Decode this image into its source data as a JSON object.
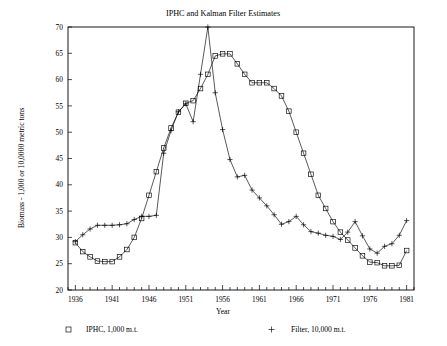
{
  "chart_data": {
    "type": "line",
    "title": "IPHC and Kalman Filter Estimates",
    "xlabel": "Year",
    "ylabel": "Biomass - 1,000 or 10,0000 metric tons",
    "xlim": [
      1935,
      1982
    ],
    "ylim": [
      20,
      70
    ],
    "yticks": [
      20,
      25,
      30,
      35,
      40,
      45,
      50,
      55,
      60,
      65,
      70
    ],
    "xticks": [
      1936,
      1941,
      1946,
      1951,
      1956,
      1961,
      1966,
      1971,
      1976,
      1981
    ],
    "grid": false,
    "legend_position": "below",
    "x": [
      1936,
      1937,
      1938,
      1939,
      1940,
      1941,
      1942,
      1943,
      1944,
      1945,
      1946,
      1947,
      1948,
      1949,
      1950,
      1951,
      1952,
      1953,
      1954,
      1955,
      1956,
      1957,
      1958,
      1959,
      1960,
      1961,
      1962,
      1963,
      1964,
      1965,
      1966,
      1967,
      1968,
      1969,
      1970,
      1971,
      1972,
      1973,
      1974,
      1975,
      1976,
      1977,
      1978,
      1979,
      1980,
      1981
    ],
    "series": [
      {
        "name": "IPHC, 1,000 m.t.",
        "marker": "square",
        "values": [
          29.0,
          27.3,
          26.3,
          25.5,
          25.4,
          25.4,
          26.3,
          27.7,
          30.0,
          33.6,
          38.0,
          42.5,
          47.0,
          50.8,
          53.8,
          55.5,
          56.0,
          58.3,
          61.0,
          64.5,
          64.9,
          64.9,
          63.0,
          61.0,
          59.4,
          59.4,
          59.4,
          58.3,
          56.9,
          54.0,
          50.0,
          46.0,
          42.0,
          38.0,
          35.5,
          33.0,
          31.0,
          29.5,
          28.0,
          26.5,
          25.3,
          25.2,
          24.6,
          24.6,
          24.7,
          27.5
        ]
      },
      {
        "name": "Filter, 10,000 m.t.",
        "marker": "plus",
        "values": [
          29.2,
          30.5,
          31.6,
          32.3,
          32.3,
          32.3,
          32.4,
          32.6,
          33.4,
          34.0,
          34.0,
          34.2,
          46.0,
          50.3,
          53.9,
          55.4,
          52.0,
          61.0,
          70.0,
          57.5,
          50.5,
          44.8,
          41.5,
          41.8,
          39.0,
          37.5,
          36.0,
          34.3,
          32.5,
          33.0,
          34.0,
          32.4,
          31.1,
          30.8,
          30.4,
          30.2,
          29.6,
          31.0,
          33.0,
          30.3,
          27.8,
          27.0,
          28.3,
          28.8,
          30.4,
          33.2
        ]
      }
    ]
  },
  "legend": {
    "entries": [
      {
        "symbol": "square-marker",
        "label": "IPHC, 1,000 m.t."
      },
      {
        "symbol": "plus-marker",
        "label": "Filter, 10,000 m.t."
      }
    ]
  },
  "colors": {
    "ink": "#000000",
    "background": "#ffffff"
  }
}
